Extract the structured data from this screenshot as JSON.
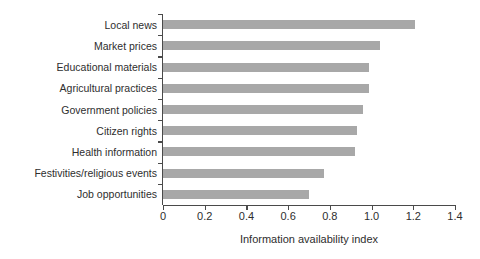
{
  "chart_data": {
    "type": "bar",
    "orientation": "horizontal",
    "title": "",
    "xlabel": "Information availability index",
    "ylabel": "",
    "xlim": [
      0,
      1.4
    ],
    "xticks": [
      "0",
      "0.2",
      "0.4",
      "0.6",
      "0.8",
      "1.0",
      "1.2",
      "1.4"
    ],
    "xtick_values": [
      0,
      0.2,
      0.4,
      0.6,
      0.8,
      1.0,
      1.2,
      1.4
    ],
    "grid": false,
    "legend": null,
    "categories": [
      "Local news",
      "Market prices",
      "Educational materials",
      "Agricultural practices",
      "Government policies",
      "Citizen rights",
      "Health information",
      "Festivities/religious events",
      "Job opportunities"
    ],
    "values": [
      1.21,
      1.04,
      0.99,
      0.99,
      0.96,
      0.93,
      0.92,
      0.77,
      0.7
    ],
    "bar_color": "#a8a8a8",
    "axis_color": "#4a4a4a",
    "text_color": "#2e2e2e",
    "background_color": "#ffffff"
  }
}
